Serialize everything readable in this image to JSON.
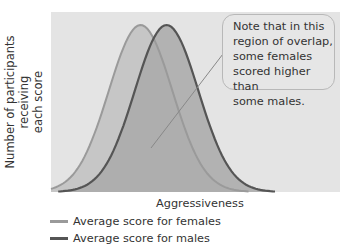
{
  "chart_data": {
    "type": "area",
    "title": "",
    "xlabel": "Aggressiveness",
    "ylabel": "Number of participants receiving each score",
    "grid": false,
    "legend_position": "bottom-left",
    "series": [
      {
        "name": "Average score for females",
        "distribution": "normal",
        "relative_mean": 0.31,
        "relative_sd": 0.11,
        "color": "#9a9a9a",
        "fill": "#c9c9c9"
      },
      {
        "name": "Average score for males",
        "distribution": "normal",
        "relative_mean": 0.4,
        "relative_sd": 0.11,
        "color": "#555555",
        "fill": "#a8a8a8"
      }
    ],
    "annotations": [
      "Note that in this region of overlap, some females scored higher than some males."
    ]
  },
  "axes": {
    "ylabel_line1": "Number of participants receiving",
    "ylabel_line2": "each score",
    "xlabel": "Aggressiveness"
  },
  "callout": {
    "text": "Note that in this\nregion of overlap,\nsome females\nscored higher than\nsome males."
  },
  "legend": [
    {
      "label": "Average score for females",
      "color": "#9a9a9a"
    },
    {
      "label": "Average score for males",
      "color": "#555555"
    }
  ],
  "colors": {
    "plot_bg": "#e4e4e4",
    "female_fill": "#c6c6c6",
    "male_fill": "#a9a9a9",
    "female_line": "#9a9a9a",
    "male_line": "#555555"
  }
}
